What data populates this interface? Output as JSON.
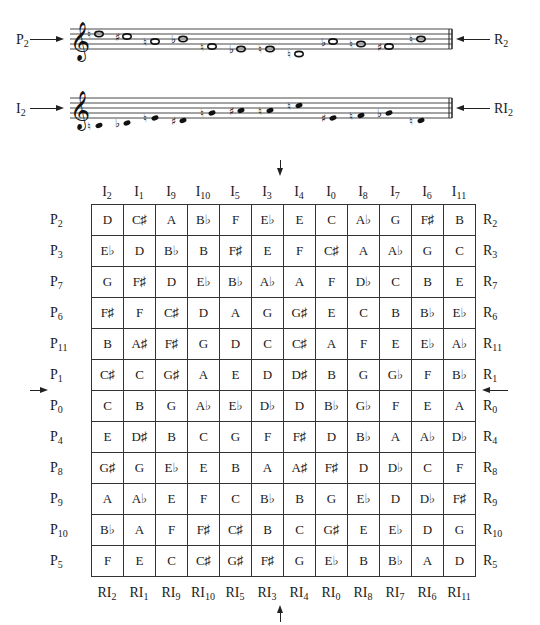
{
  "staves": [
    {
      "id": "prime",
      "left_label": {
        "base": "P",
        "sub": "2"
      },
      "right_label": {
        "base": "R",
        "sub": "2"
      },
      "clef": "treble",
      "note_style": "whole",
      "notes": [
        {
          "name": "D",
          "acc": "natural",
          "y": 34
        },
        {
          "name": "C#",
          "acc": "sharp",
          "y": 36.5
        },
        {
          "name": "A",
          "acc": "natural",
          "y": 41.5
        },
        {
          "name": "Bb",
          "acc": "flat",
          "y": 39
        },
        {
          "name": "F",
          "acc": "natural",
          "y": 46.5
        },
        {
          "name": "Eb",
          "acc": "flat",
          "y": 49
        },
        {
          "name": "E",
          "acc": "natural",
          "y": 49
        },
        {
          "name": "C",
          "acc": "natural",
          "y": 54
        },
        {
          "name": "Ab",
          "acc": "flat",
          "y": 41.5
        },
        {
          "name": "G",
          "acc": "natural",
          "y": 44
        },
        {
          "name": "F#",
          "acc": "sharp",
          "y": 46.5
        },
        {
          "name": "B",
          "acc": "natural",
          "y": 39
        }
      ]
    },
    {
      "id": "inversion",
      "left_label": {
        "base": "I",
        "sub": "2"
      },
      "right_label": {
        "base": "RI",
        "sub": "2"
      },
      "clef": "treble",
      "note_style": "filled",
      "notes": [
        {
          "name": "D",
          "acc": "natural",
          "y": 125.5
        },
        {
          "name": "Eb",
          "acc": "flat",
          "y": 123
        },
        {
          "name": "G",
          "acc": "natural",
          "y": 118
        },
        {
          "name": "F#",
          "acc": "sharp",
          "y": 120.5
        },
        {
          "name": "B",
          "acc": "natural",
          "y": 113
        },
        {
          "name": "C#",
          "acc": "sharp",
          "y": 110.5
        },
        {
          "name": "C",
          "acc": "natural",
          "y": 110.5
        },
        {
          "name": "E",
          "acc": "natural",
          "y": 105.5
        },
        {
          "name": "G#",
          "acc": "sharp",
          "y": 118
        },
        {
          "name": "A",
          "acc": "natural",
          "y": 115.5
        },
        {
          "name": "Bb",
          "acc": "flat",
          "y": 113
        },
        {
          "name": "F",
          "acc": "natural",
          "y": 120.5
        }
      ]
    }
  ],
  "matrix": {
    "column_headers": [
      {
        "base": "I",
        "sub": "2"
      },
      {
        "base": "I",
        "sub": "1"
      },
      {
        "base": "I",
        "sub": "9"
      },
      {
        "base": "I",
        "sub": "10"
      },
      {
        "base": "I",
        "sub": "5"
      },
      {
        "base": "I",
        "sub": "3"
      },
      {
        "base": "I",
        "sub": "4"
      },
      {
        "base": "I",
        "sub": "0"
      },
      {
        "base": "I",
        "sub": "8"
      },
      {
        "base": "I",
        "sub": "7"
      },
      {
        "base": "I",
        "sub": "6"
      },
      {
        "base": "I",
        "sub": "11"
      }
    ],
    "column_footers": [
      {
        "base": "RI",
        "sub": "2"
      },
      {
        "base": "RI",
        "sub": "1"
      },
      {
        "base": "RI",
        "sub": "9"
      },
      {
        "base": "RI",
        "sub": "10"
      },
      {
        "base": "RI",
        "sub": "5"
      },
      {
        "base": "RI",
        "sub": "3"
      },
      {
        "base": "RI",
        "sub": "4"
      },
      {
        "base": "RI",
        "sub": "0"
      },
      {
        "base": "RI",
        "sub": "8"
      },
      {
        "base": "RI",
        "sub": "7"
      },
      {
        "base": "RI",
        "sub": "6"
      },
      {
        "base": "RI",
        "sub": "11"
      }
    ],
    "row_left_labels": [
      {
        "base": "P",
        "sub": "2"
      },
      {
        "base": "P",
        "sub": "3"
      },
      {
        "base": "P",
        "sub": "7"
      },
      {
        "base": "P",
        "sub": "6"
      },
      {
        "base": "P",
        "sub": "11"
      },
      {
        "base": "P",
        "sub": "1"
      },
      {
        "base": "P",
        "sub": "0"
      },
      {
        "base": "P",
        "sub": "4"
      },
      {
        "base": "P",
        "sub": "8"
      },
      {
        "base": "P",
        "sub": "9"
      },
      {
        "base": "P",
        "sub": "10"
      },
      {
        "base": "P",
        "sub": "5"
      }
    ],
    "row_right_labels": [
      {
        "base": "R",
        "sub": "2"
      },
      {
        "base": "R",
        "sub": "3"
      },
      {
        "base": "R",
        "sub": "7"
      },
      {
        "base": "R",
        "sub": "6"
      },
      {
        "base": "R",
        "sub": "11"
      },
      {
        "base": "R",
        "sub": "1"
      },
      {
        "base": "R",
        "sub": "0"
      },
      {
        "base": "R",
        "sub": "4"
      },
      {
        "base": "R",
        "sub": "8"
      },
      {
        "base": "R",
        "sub": "9"
      },
      {
        "base": "R",
        "sub": "10"
      },
      {
        "base": "R",
        "sub": "5"
      }
    ],
    "rows": [
      [
        "D",
        "C♯",
        "A",
        "B♭",
        "F",
        "E♭",
        "E",
        "C",
        "A♭",
        "G",
        "F♯",
        "B"
      ],
      [
        "E♭",
        "D",
        "B♭",
        "B",
        "F♯",
        "E",
        "F",
        "C♯",
        "A",
        "A♭",
        "G",
        "C"
      ],
      [
        "G",
        "F♯",
        "D",
        "E♭",
        "B♭",
        "A♭",
        "A",
        "F",
        "D♭",
        "C",
        "B",
        "E"
      ],
      [
        "F♯",
        "F",
        "C♯",
        "D",
        "A",
        "G",
        "G♯",
        "E",
        "C",
        "B",
        "B♭",
        "E♭"
      ],
      [
        "B",
        "A♯",
        "F♯",
        "G",
        "D",
        "C",
        "C♯",
        "A",
        "F",
        "E",
        "E♭",
        "A♭"
      ],
      [
        "C♯",
        "C",
        "G♯",
        "A",
        "E",
        "D",
        "D♯",
        "B",
        "G",
        "G♭",
        "F",
        "B♭"
      ],
      [
        "C",
        "B",
        "G",
        "A♭",
        "E♭",
        "D♭",
        "D",
        "B♭",
        "G♭",
        "F",
        "E",
        "A"
      ],
      [
        "E",
        "D♯",
        "B",
        "C",
        "G",
        "F",
        "F♯",
        "D",
        "B♭",
        "A",
        "A♭",
        "D♭"
      ],
      [
        "G♯",
        "G",
        "E♭",
        "E",
        "B",
        "A",
        "A♯",
        "F♯",
        "D",
        "D♭",
        "C",
        "F"
      ],
      [
        "A",
        "A♭",
        "E",
        "F",
        "C",
        "B♭",
        "B",
        "G",
        "E♭",
        "D",
        "D♭",
        "F♯"
      ],
      [
        "B♭",
        "A",
        "F",
        "F♯",
        "C♯",
        "B",
        "C",
        "G♯",
        "E",
        "E♭",
        "D",
        "G"
      ],
      [
        "F",
        "E",
        "C",
        "C♯",
        "G♯",
        "F♯",
        "G",
        "E♭",
        "B",
        "B♭",
        "A",
        "D"
      ]
    ]
  },
  "accidental_glyphs": {
    "natural": "♮",
    "sharp": "♯",
    "flat": "♭"
  }
}
